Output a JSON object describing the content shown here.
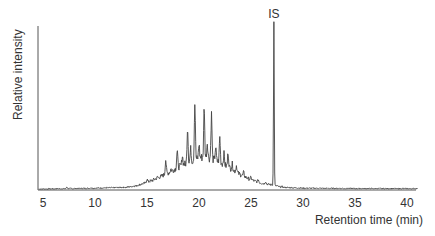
{
  "chart_data": {
    "type": "line",
    "title": "",
    "xlabel": "Retention time (min)",
    "ylabel": "Relative intensity",
    "xlim": [
      4.5,
      41
    ],
    "ylim": [
      0,
      100
    ],
    "grid": false,
    "legend": null,
    "x_ticks": [
      5,
      10,
      15,
      20,
      25,
      30,
      35,
      40
    ],
    "x_tick_labels": [
      "5",
      "10",
      "15",
      "20",
      "25",
      "30",
      "35",
      "40"
    ],
    "y_ticks": [],
    "annotations": [
      {
        "text": "IS",
        "x": 27.2,
        "y": 100
      }
    ],
    "baseline_hump": {
      "description": "unresolved complex mixture hump",
      "x": [
        5,
        10,
        13,
        14,
        15,
        16,
        17,
        18,
        19,
        20,
        20.5,
        21,
        22,
        23,
        24,
        25,
        26,
        27,
        28,
        30,
        35,
        40
      ],
      "y": [
        0,
        0.5,
        1,
        2,
        4,
        6.5,
        9.5,
        13,
        16,
        18.5,
        19.2,
        18.5,
        16,
        12.5,
        8.5,
        5.5,
        3.5,
        2.5,
        1,
        0.5,
        0.3,
        0.2
      ]
    },
    "peaks": [
      {
        "x": 7.3,
        "y": 1.2
      },
      {
        "x": 9.6,
        "y": 0.8
      },
      {
        "x": 15.0,
        "y": 6.0
      },
      {
        "x": 15.5,
        "y": 5.0
      },
      {
        "x": 16.0,
        "y": 7.0
      },
      {
        "x": 16.8,
        "y": 17.5
      },
      {
        "x": 17.3,
        "y": 12.0
      },
      {
        "x": 17.9,
        "y": 23.0
      },
      {
        "x": 18.4,
        "y": 20.0
      },
      {
        "x": 18.9,
        "y": 37.0
      },
      {
        "x": 19.2,
        "y": 24.0
      },
      {
        "x": 19.6,
        "y": 51.0
      },
      {
        "x": 20.0,
        "y": 27.0
      },
      {
        "x": 20.5,
        "y": 49.0
      },
      {
        "x": 20.8,
        "y": 28.0
      },
      {
        "x": 21.2,
        "y": 45.0
      },
      {
        "x": 21.6,
        "y": 25.0
      },
      {
        "x": 22.0,
        "y": 31.0
      },
      {
        "x": 22.4,
        "y": 21.0
      },
      {
        "x": 22.8,
        "y": 22.0
      },
      {
        "x": 23.2,
        "y": 15.0
      },
      {
        "x": 23.6,
        "y": 14.0
      },
      {
        "x": 24.3,
        "y": 10.0
      },
      {
        "x": 25.0,
        "y": 7.0
      },
      {
        "x": 25.7,
        "y": 5.5
      },
      {
        "x": 26.4,
        "y": 4.5
      },
      {
        "x": 27.2,
        "y": 100.0,
        "label": "IS"
      },
      {
        "x": 28.0,
        "y": 1.5
      }
    ]
  }
}
